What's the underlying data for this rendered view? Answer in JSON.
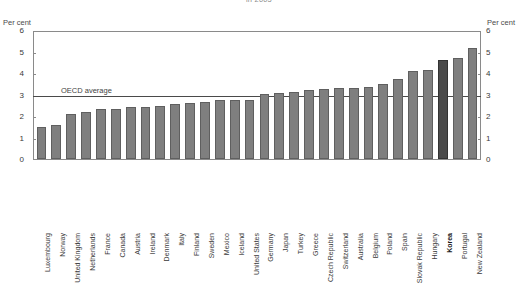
{
  "chart_data": {
    "type": "bar",
    "title": "in 2005",
    "xlabel": "",
    "ylabel": "Per cent",
    "ylabel_right": "Per cent",
    "ylim": [
      0,
      6
    ],
    "yticks": [
      0,
      1,
      2,
      3,
      4,
      5,
      6
    ],
    "grid": false,
    "legend": null,
    "annotations": [
      {
        "label": "OECD average",
        "value": 3.0,
        "type": "horizontal-line"
      }
    ],
    "highlight_category": "Korea",
    "colors": {
      "bar": "#7f7f7f",
      "bar_border": "#5f5f5f",
      "bar_highlight": "#4a4a4a",
      "bar_highlight_border": "#333333",
      "axis": "#8a8a8a",
      "average_line": "#4a4a4a",
      "text": "#3a3a3a"
    },
    "categories": [
      "Luxembourg",
      "Norway",
      "United Kingdom",
      "Netherlands",
      "France",
      "Canada",
      "Austria",
      "Ireland",
      "Denmark",
      "Italy",
      "Finland",
      "Sweden",
      "Mexico",
      "Iceland",
      "United States",
      "Germany",
      "Japan",
      "Turkey",
      "Greece",
      "Czech Republic",
      "Switzerland",
      "Australia",
      "Belgium",
      "Poland",
      "Spain",
      "Slovak Republic",
      "Hungary",
      "Korea",
      "Portugal",
      "New Zealand"
    ],
    "values": [
      1.5,
      1.6,
      2.15,
      2.2,
      2.35,
      2.35,
      2.45,
      2.45,
      2.5,
      2.6,
      2.65,
      2.7,
      2.8,
      2.8,
      2.8,
      3.05,
      3.1,
      3.15,
      3.25,
      3.3,
      3.35,
      3.35,
      3.4,
      3.55,
      3.8,
      4.15,
      4.2,
      4.7,
      4.75,
      5.25
    ]
  }
}
